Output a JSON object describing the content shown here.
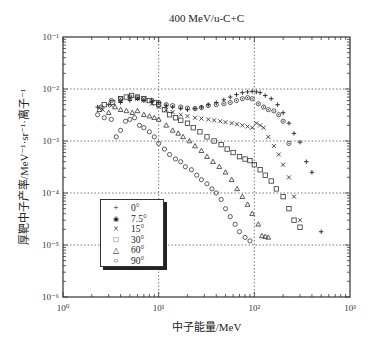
{
  "chart_data": {
    "type": "scatter",
    "title": "400 MeV/u-C+C",
    "xlabel": "中子能量/MeV",
    "ylabel": "厚靶中子产率/MeV⁻¹·sr⁻¹·离子⁻¹",
    "xscale": "log",
    "yscale": "log",
    "xlim": [
      1,
      1000
    ],
    "ylim": [
      1e-06,
      0.1
    ],
    "x_ticks": [
      "10⁰",
      "10¹",
      "10²",
      "10³"
    ],
    "y_ticks": [
      "10⁻¹",
      "10⁻²",
      "10⁻³",
      "10⁻⁴",
      "10⁻⁵",
      "10⁻⁶"
    ],
    "grid": "dotted at decades",
    "legend_position": "lower left inside",
    "series": [
      {
        "name": "0°",
        "marker": "plus",
        "x": [
          2.3,
          3.0,
          4.0,
          5.0,
          6.0,
          7.0,
          8.5,
          10,
          12,
          14,
          17,
          20,
          24,
          28,
          33,
          40,
          48,
          56,
          65,
          75,
          85,
          95,
          105,
          115,
          130,
          150,
          175,
          200,
          230,
          260,
          300,
          350,
          400,
          500
        ],
        "y": [
          0.0045,
          0.005,
          0.0055,
          0.006,
          0.0065,
          0.006,
          0.0058,
          0.0055,
          0.0048,
          0.0045,
          0.0042,
          0.004,
          0.0042,
          0.0045,
          0.005,
          0.0055,
          0.0062,
          0.007,
          0.0078,
          0.0085,
          0.0088,
          0.009,
          0.0088,
          0.0085,
          0.0075,
          0.0065,
          0.005,
          0.0035,
          0.0022,
          0.0014,
          0.00095,
          0.0004,
          0.00025,
          1.8e-05
        ]
      },
      {
        "name": "7.5°",
        "marker": "circle-dot",
        "x": [
          2.5,
          3.2,
          4.0,
          5.0,
          6.0,
          7.0,
          8.5,
          10,
          12,
          14,
          17,
          20,
          24,
          28,
          33,
          40,
          48,
          56,
          65,
          75,
          85,
          95,
          110,
          125,
          140,
          160,
          180,
          200,
          230
        ],
        "y": [
          0.0045,
          0.006,
          0.0065,
          0.007,
          0.0068,
          0.0065,
          0.006,
          0.0055,
          0.005,
          0.0048,
          0.0045,
          0.0043,
          0.0042,
          0.0044,
          0.0048,
          0.005,
          0.0052,
          0.0055,
          0.006,
          0.0065,
          0.0068,
          0.0065,
          0.0052,
          0.0045,
          0.004,
          0.0038,
          0.0032,
          0.0024,
          0.0009
        ]
      },
      {
        "name": "15°",
        "marker": "cross",
        "x": [
          2.6,
          3.2,
          4.0,
          5.0,
          6.0,
          7.0,
          8.5,
          10,
          12,
          14,
          17,
          20,
          24,
          28,
          33,
          38,
          44,
          50,
          58,
          66,
          75,
          85,
          95,
          105,
          115,
          125,
          140,
          160,
          180,
          200,
          230,
          260,
          300
        ],
        "y": [
          0.004,
          0.0048,
          0.006,
          0.0068,
          0.0065,
          0.006,
          0.0052,
          0.0045,
          0.004,
          0.0036,
          0.0032,
          0.003,
          0.0028,
          0.0027,
          0.0026,
          0.0025,
          0.0024,
          0.0023,
          0.0022,
          0.0021,
          0.002,
          0.0019,
          0.0018,
          0.0022,
          0.002,
          0.0018,
          0.0012,
          0.0008,
          0.00055,
          0.00035,
          0.0002,
          8.5e-05,
          3e-05
        ]
      },
      {
        "name": "30°",
        "marker": "square",
        "x": [
          2.7,
          3.3,
          4.0,
          4.6,
          5.2,
          6.0,
          7.0,
          8.0,
          9.0,
          10,
          11.5,
          13,
          15,
          17,
          20,
          23,
          27,
          32,
          38,
          45,
          52,
          60,
          70,
          80,
          90,
          100,
          115,
          130,
          150,
          170,
          200,
          230,
          260,
          300
        ],
        "y": [
          0.005,
          0.0055,
          0.0065,
          0.007,
          0.0075,
          0.007,
          0.0065,
          0.006,
          0.0055,
          0.005,
          0.004,
          0.0032,
          0.0028,
          0.0025,
          0.0022,
          0.0018,
          0.0015,
          0.0012,
          0.001,
          0.00085,
          0.0007,
          0.0006,
          0.0005,
          0.00045,
          0.00042,
          0.00035,
          0.00028,
          0.00022,
          0.00017,
          0.00012,
          8.5e-05,
          5e-05,
          3e-05,
          2.2e-05
        ]
      },
      {
        "name": "60°",
        "marker": "triangle",
        "x": [
          2.4,
          3.0,
          3.5,
          4.0,
          4.6,
          5.3,
          6.0,
          7.0,
          8.0,
          9.0,
          10,
          12,
          14,
          16,
          18,
          21,
          24,
          28,
          32,
          37,
          43,
          50,
          58,
          66,
          75,
          85,
          95,
          110,
          120,
          130,
          140
        ],
        "y": [
          0.004,
          0.0035,
          0.0045,
          0.004,
          0.0038,
          0.0035,
          0.0038,
          0.0032,
          0.003,
          0.0028,
          0.0026,
          0.002,
          0.0016,
          0.0014,
          0.0012,
          0.001,
          0.0008,
          0.00065,
          0.0005,
          0.0004,
          0.00032,
          0.00025,
          0.00018,
          0.00012,
          8.5e-05,
          6e-05,
          4e-05,
          2.5e-05,
          1.5e-05,
          1.45e-05,
          1.4e-05
        ]
      },
      {
        "name": "90°",
        "marker": "circle",
        "x": [
          2.3,
          2.7,
          3.2,
          3.6,
          4.0,
          4.5,
          5.0,
          5.6,
          6.3,
          7.0,
          8.0,
          9.0,
          10,
          11.5,
          13,
          15,
          17,
          19,
          22,
          25,
          28,
          32,
          36,
          40,
          45,
          50,
          56,
          63,
          70,
          80,
          90
        ],
        "y": [
          0.0032,
          0.0028,
          0.0026,
          0.0012,
          0.0016,
          0.0024,
          0.0026,
          0.0028,
          0.002,
          0.0018,
          0.0015,
          0.0012,
          0.0009,
          0.0007,
          0.00055,
          0.00045,
          0.0004,
          0.00032,
          0.00028,
          0.00022,
          0.00018,
          0.00015,
          0.00012,
          0.0001,
          7.5e-05,
          5e-05,
          3.5e-05,
          2.5e-05,
          1.8e-05,
          1.4e-05,
          1.2e-05
        ]
      }
    ]
  },
  "legend": {
    "items": [
      {
        "symbol": "+",
        "label": "0°"
      },
      {
        "symbol": "◉",
        "label": "7.5°"
      },
      {
        "symbol": "×",
        "label": "15°"
      },
      {
        "symbol": "□",
        "label": "30°"
      },
      {
        "symbol": "△",
        "label": "60°"
      },
      {
        "symbol": "○",
        "label": "90°"
      }
    ]
  }
}
